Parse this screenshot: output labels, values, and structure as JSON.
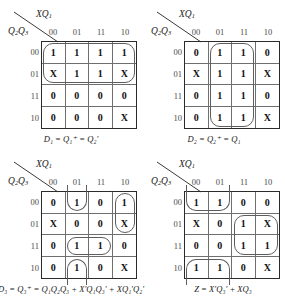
{
  "figure": {
    "axis": {
      "top_label_html": "XQ1",
      "side_label_html": "Q2Q3",
      "col_headers": [
        "00",
        "01",
        "11",
        "10"
      ],
      "row_headers": [
        "00",
        "01",
        "11",
        "10"
      ]
    },
    "colors": {
      "grid_outer": "#2b2b2b",
      "grid_inner": "#6f6f6f",
      "group_outline": "#5d5d5d",
      "text": "#111111",
      "header_text": "#4a4a4a",
      "background": "#ffffff"
    },
    "maps": [
      {
        "id": "map-d1",
        "caption": "D₁ = Q₁⁺ = Q₂′",
        "rows": [
          [
            "1",
            "1",
            "1",
            "1"
          ],
          [
            "X",
            "1",
            "1",
            "X"
          ],
          [
            "0",
            "0",
            "0",
            "0"
          ],
          [
            "0",
            "0",
            "0",
            "X"
          ]
        ],
        "groups": [
          {
            "row": 0,
            "col": 0,
            "rowspan": 2,
            "colspan": 4
          }
        ]
      },
      {
        "id": "map-d2",
        "caption": "D₂ = Q₂⁺ = Q₁",
        "rows": [
          [
            "0",
            "1",
            "1",
            "0"
          ],
          [
            "X",
            "1",
            "1",
            "X"
          ],
          [
            "0",
            "1",
            "1",
            "0"
          ],
          [
            "0",
            "1",
            "1",
            "X"
          ]
        ],
        "groups": [
          {
            "row": 0,
            "col": 1,
            "rowspan": 4,
            "colspan": 2
          }
        ]
      },
      {
        "id": "map-d3",
        "caption": "D₃ = Q₃⁺ = Q₁Q₂Q₃ + X′Q₁Q₃′ + XQ₁′Q₂′",
        "rows": [
          [
            "0",
            "1",
            "0",
            "1"
          ],
          [
            "X",
            "0",
            "0",
            "X"
          ],
          [
            "0",
            "1",
            "1",
            "0"
          ],
          [
            "0",
            "1",
            "0",
            "X"
          ]
        ],
        "groups": [
          {
            "row": 0,
            "col": 3,
            "rowspan": 2,
            "colspan": 1
          },
          {
            "row": 2,
            "col": 1,
            "rowspan": 1,
            "colspan": 2
          },
          {
            "row": 0,
            "col": 1,
            "rowspan": 1,
            "colspan": 1,
            "wrap": "top"
          },
          {
            "row": 3,
            "col": 1,
            "rowspan": 1,
            "colspan": 1,
            "wrap": "bottom"
          }
        ]
      },
      {
        "id": "map-z",
        "caption": "Z = X′Q₃′ + XQ₃",
        "rows": [
          [
            "1",
            "1",
            "0",
            "0"
          ],
          [
            "X",
            "0",
            "1",
            "X"
          ],
          [
            "0",
            "0",
            "1",
            "1"
          ],
          [
            "1",
            "1",
            "0",
            "X"
          ]
        ],
        "groups": [
          {
            "row": 1,
            "col": 2,
            "rowspan": 2,
            "colspan": 2
          },
          {
            "row": 0,
            "col": 0,
            "rowspan": 1,
            "colspan": 2,
            "wrap": "top"
          },
          {
            "row": 3,
            "col": 0,
            "rowspan": 1,
            "colspan": 2,
            "wrap": "bottom"
          }
        ]
      }
    ]
  }
}
